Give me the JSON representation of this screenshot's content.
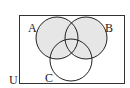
{
  "diagram": {
    "type": "venn",
    "universe_label": "U",
    "sets": [
      {
        "label": "A",
        "cx": 57,
        "cy": 38,
        "r": 21
      },
      {
        "label": "B",
        "cx": 86,
        "cy": 38,
        "r": 21
      },
      {
        "label": "C",
        "cx": 71,
        "cy": 60,
        "r": 21
      }
    ],
    "shaded_region": "A ∪ B",
    "colors": {
      "stroke": "#222222",
      "shade": "#e6e6e6",
      "background": "#ffffff"
    }
  }
}
